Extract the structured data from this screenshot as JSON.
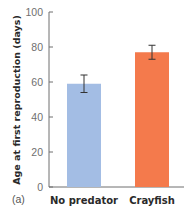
{
  "chart_data": {
    "type": "bar",
    "title": "",
    "panel_label": "(a)",
    "xlabel": "",
    "ylabel": "Age at first reproduction (days)",
    "ylim": [
      0,
      100
    ],
    "yticks": [
      0,
      20,
      40,
      60,
      80,
      100
    ],
    "grid": false,
    "legend": null,
    "categories": [
      "No predator",
      "Crayfish"
    ],
    "values": [
      59,
      77
    ],
    "error_bars": [
      {
        "low": 54,
        "high": 64
      },
      {
        "low": 73,
        "high": 81
      }
    ],
    "colors": [
      "#a3bde4",
      "#f47a4c"
    ]
  },
  "axis": {
    "color": "#6f6f6f",
    "error_bar_color": "#333333"
  }
}
